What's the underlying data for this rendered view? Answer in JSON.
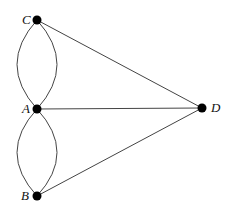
{
  "diagram": {
    "title": "",
    "nodes": [
      {
        "id": "C",
        "label": "C",
        "x": 37,
        "y": 20,
        "label_x": 22,
        "label_y": 24
      },
      {
        "id": "A",
        "label": "A",
        "x": 37,
        "y": 109,
        "label_x": 22,
        "label_y": 113
      },
      {
        "id": "B",
        "label": "B",
        "x": 37,
        "y": 196,
        "label_x": 21,
        "label_y": 200
      },
      {
        "id": "D",
        "label": "D",
        "x": 202,
        "y": 108,
        "label_x": 211,
        "label_y": 112
      }
    ],
    "edges": [
      {
        "from": "C",
        "to": "A",
        "type": "curve-left"
      },
      {
        "from": "C",
        "to": "A",
        "type": "curve-right"
      },
      {
        "from": "A",
        "to": "B",
        "type": "curve-left"
      },
      {
        "from": "A",
        "to": "B",
        "type": "curve-right"
      },
      {
        "from": "C",
        "to": "D",
        "type": "straight"
      },
      {
        "from": "A",
        "to": "D",
        "type": "straight"
      },
      {
        "from": "B",
        "to": "D",
        "type": "straight"
      }
    ],
    "colors": {
      "edge": "#444444",
      "node": "#000000",
      "background": "#ffffff"
    }
  }
}
